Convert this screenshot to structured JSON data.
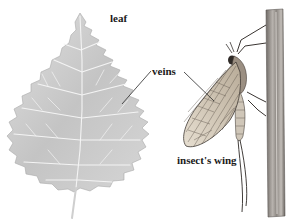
{
  "figure": {
    "type": "labeled-illustration",
    "labels": {
      "leaf": "leaf",
      "veins": "veins",
      "insect_wing": "insect's wing"
    },
    "subjects": [
      "leaf",
      "mayfly insect on plant stalk"
    ],
    "colors": {
      "leaf_fill": "#c9c9c9",
      "leaf_veins": "#f2f2f2",
      "wing_fill": "#d8cfbf",
      "wing_veins": "#5a5048",
      "stalk": "#8a8580",
      "label_text": "#1a1a1a",
      "leader_line": "#2a2a2a"
    }
  }
}
